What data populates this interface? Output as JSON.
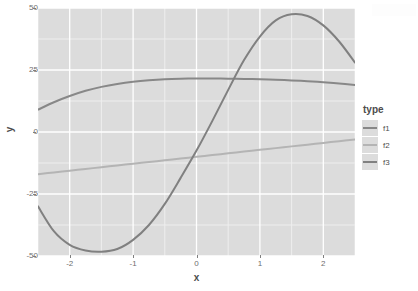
{
  "chart_data": {
    "type": "line",
    "title": "",
    "xlabel": "x",
    "ylabel": "y",
    "xlim": [
      -2.5,
      2.5
    ],
    "ylim": [
      -50,
      50
    ],
    "xticks": [
      -2,
      -1,
      0,
      1,
      2
    ],
    "xticklabels": [
      "-2",
      "-1",
      "0",
      "1",
      "2"
    ],
    "yticks": [
      -50,
      -25,
      0,
      25,
      50
    ],
    "yticklabels": [
      "-50",
      "-25",
      "0",
      "25",
      "50"
    ],
    "grid": true,
    "grid_major_color": "#ffffff",
    "grid_minor_color": "#eeeeee",
    "panel_background": "#dcdcdc",
    "legend_position": "right",
    "legend_title": "type",
    "x": [
      -2.5,
      -2.25,
      -2,
      -1.75,
      -1.5,
      -1.25,
      -1,
      -0.75,
      -0.5,
      -0.25,
      0,
      0.25,
      0.5,
      0.75,
      1,
      1.25,
      1.5,
      1.75,
      2,
      2.25,
      2.5
    ],
    "series": [
      {
        "name": "f1",
        "color": "#888888",
        "values": [
          9,
          12,
          14.5,
          16.6,
          18.2,
          19.4,
          20.3,
          20.9,
          21.3,
          21.5,
          21.6,
          21.6,
          21.5,
          21.4,
          21.3,
          21.1,
          20.8,
          20.5,
          20.1,
          19.6,
          19
        ]
      },
      {
        "name": "f2",
        "color": "#b4b4b4",
        "values": [
          -17,
          -16.3,
          -15.6,
          -14.9,
          -14.2,
          -13.5,
          -12.8,
          -12.1,
          -11.4,
          -10.7,
          -10,
          -9.3,
          -8.6,
          -7.9,
          -7.2,
          -6.5,
          -5.8,
          -5.1,
          -4.4,
          -3.7,
          -3
        ]
      },
      {
        "name": "f3",
        "color": "#808080",
        "values": [
          -30,
          -40,
          -45.5,
          -47.8,
          -48.3,
          -47.2,
          -43.5,
          -37.5,
          -29,
          -18.5,
          -7.5,
          4.5,
          17,
          29,
          38.5,
          45,
          47.5,
          46.8,
          43,
          36.5,
          28
        ]
      }
    ]
  },
  "legend": {
    "title": "type",
    "items": [
      {
        "label": "f1",
        "color": "#888888"
      },
      {
        "label": "f2",
        "color": "#b4b4b4"
      },
      {
        "label": "f3",
        "color": "#808080"
      }
    ]
  },
  "axes": {
    "x_title": "x",
    "y_title": "y"
  }
}
